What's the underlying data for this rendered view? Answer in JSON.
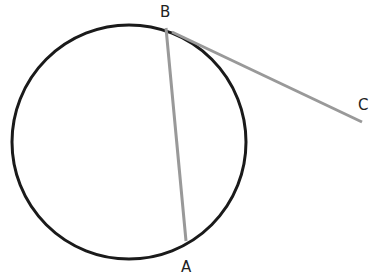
{
  "diagram": {
    "type": "geometry",
    "circle": {
      "cx": 129,
      "cy": 142,
      "r": 117,
      "stroke": "#1a1a1a"
    },
    "segments": [
      {
        "name": "chord-BA",
        "from": "B",
        "to": "A",
        "color": "#999999"
      },
      {
        "name": "tangent-BC",
        "from": "B",
        "to": "C",
        "color": "#999999"
      }
    ],
    "points": [
      {
        "id": "B",
        "label": "B",
        "x": 166,
        "y": 28,
        "label_x": 160,
        "label_y": 17
      },
      {
        "id": "A",
        "label": "A",
        "x": 186,
        "y": 241,
        "label_x": 181,
        "label_y": 272
      },
      {
        "id": "C",
        "label": "C",
        "x": 362,
        "y": 122,
        "label_x": 358,
        "label_y": 110
      }
    ]
  }
}
